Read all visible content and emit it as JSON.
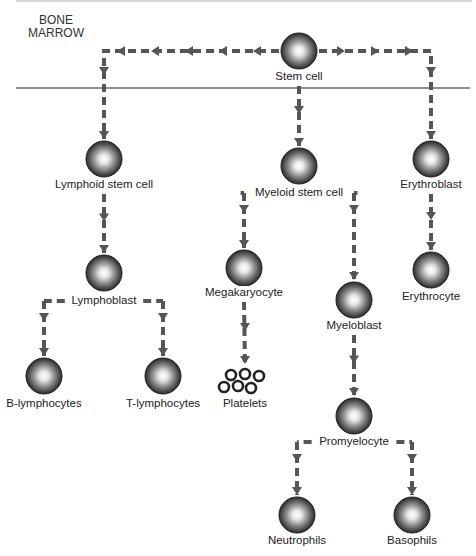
{
  "diagram": {
    "region_label": "BONE MARROW",
    "colors": {
      "arrow": "#555555",
      "divider": "#222222",
      "cell_dark": "#2a2a2a",
      "cell_light": "#ffffff"
    },
    "cells": [
      {
        "id": "stem",
        "label": "Stem cell",
        "x": 299,
        "y": 51,
        "label_y": 70
      },
      {
        "id": "lymphoid",
        "label": "Lymphoid stem cell",
        "x": 104,
        "y": 159,
        "label_y": 178
      },
      {
        "id": "myeloid",
        "label": "Myeloid stem cell",
        "x": 299,
        "y": 166,
        "label_y": 186
      },
      {
        "id": "erythroblast",
        "label": "Erythroblast",
        "x": 431,
        "y": 159,
        "label_y": 178
      },
      {
        "id": "lymphoblast",
        "label": "Lymphoblast",
        "x": 104,
        "y": 273,
        "label_y": 294
      },
      {
        "id": "megakaryocyte",
        "label": "Megakaryocyte",
        "x": 244,
        "y": 268,
        "label_y": 286
      },
      {
        "id": "myeloblast",
        "label": "Myeloblast",
        "x": 354,
        "y": 300,
        "label_y": 319
      },
      {
        "id": "erythrocyte",
        "label": "Erythrocyte",
        "x": 431,
        "y": 270,
        "label_y": 290
      },
      {
        "id": "b_lymphocytes",
        "label": "B-lymphocytes",
        "x": 44,
        "y": 376,
        "label_y": 397
      },
      {
        "id": "t_lymphocytes",
        "label": "T-lymphocytes",
        "x": 163,
        "y": 376,
        "label_y": 397
      },
      {
        "id": "promyelocyte",
        "label": "Promyelocyte",
        "x": 354,
        "y": 416,
        "label_y": 435
      },
      {
        "id": "neutrophils",
        "label": "Neutrophils",
        "x": 297,
        "y": 515,
        "label_y": 534
      },
      {
        "id": "basophils",
        "label": "Basophils",
        "x": 412,
        "y": 515,
        "label_y": 534
      }
    ],
    "platelets": {
      "label": "Platelets",
      "x": 245,
      "label_y": 397
    },
    "edges": [
      {
        "from": "stem",
        "to": "lymphoid"
      },
      {
        "from": "stem",
        "to": "myeloid"
      },
      {
        "from": "stem",
        "to": "erythroblast"
      },
      {
        "from": "lymphoid",
        "to": "lymphoblast"
      },
      {
        "from": "lymphoblast",
        "to": "b_lymphocytes"
      },
      {
        "from": "lymphoblast",
        "to": "t_lymphocytes"
      },
      {
        "from": "myeloid",
        "to": "megakaryocyte"
      },
      {
        "from": "myeloid",
        "to": "myeloblast"
      },
      {
        "from": "megakaryocyte",
        "to": "platelets"
      },
      {
        "from": "myeloblast",
        "to": "promyelocyte"
      },
      {
        "from": "promyelocyte",
        "to": "neutrophils"
      },
      {
        "from": "promyelocyte",
        "to": "basophils"
      },
      {
        "from": "erythroblast",
        "to": "erythrocyte"
      }
    ]
  }
}
